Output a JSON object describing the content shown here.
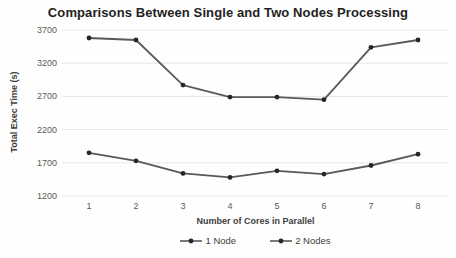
{
  "chart_data": {
    "type": "line",
    "title": "Comparisons Between Single and Two Nodes Processing",
    "xlabel": "Number of Cores in Parallel",
    "ylabel": "Total Exec Time (s)",
    "categories": [
      "1",
      "2",
      "3",
      "4",
      "5",
      "6",
      "7",
      "8"
    ],
    "series": [
      {
        "name": "1 Node",
        "values": [
          3580,
          3550,
          2870,
          2690,
          2690,
          2650,
          3440,
          3550
        ]
      },
      {
        "name": "2 Nodes",
        "values": [
          1850,
          1730,
          1540,
          1480,
          1580,
          1530,
          1660,
          1830
        ]
      }
    ],
    "ylim": [
      1200,
      3700
    ],
    "yticks": [
      1200,
      1700,
      2200,
      2700,
      3200,
      3700
    ],
    "grid": "horizontal-only",
    "legend_position": "bottom",
    "colors": {
      "line": "#595959",
      "marker": "#262626",
      "gridline": "#e6e6e6",
      "tick_text": "#595959",
      "title_text": "#1f1f1f"
    }
  }
}
